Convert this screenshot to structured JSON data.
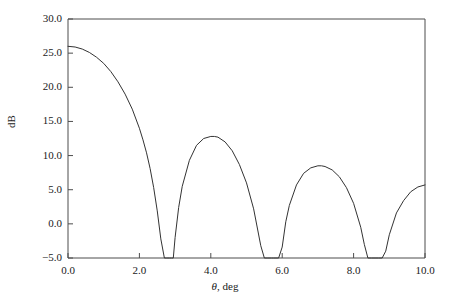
{
  "chart_data": {
    "type": "line",
    "title": "",
    "xlabel": "θ, deg",
    "ylabel": "dB",
    "xlim": [
      0.0,
      10.0
    ],
    "ylim": [
      -5.0,
      30.0
    ],
    "xticks": [
      0.0,
      2.0,
      4.0,
      6.0,
      8.0,
      10.0
    ],
    "yticks": [
      -5.0,
      0.0,
      5.0,
      10.0,
      15.0,
      20.0,
      25.0,
      30.0
    ],
    "xtick_labels": [
      "0.0",
      "2.0",
      "4.0",
      "6.0",
      "8.0",
      "10.0"
    ],
    "ytick_labels": [
      "−5.0",
      "0.0",
      "5.0",
      "10.0",
      "15.0",
      "20.0",
      "25.0",
      "30.0"
    ],
    "grid": false,
    "legend": null,
    "line_color": "#333333",
    "line_width": 1,
    "series": [
      {
        "name": "array pattern",
        "peaks": [
          {
            "x": 0.0,
            "y": 26.0
          },
          {
            "x": 4.1,
            "y": 12.8
          },
          {
            "x": 7.1,
            "y": 8.5
          },
          {
            "x": 10.0,
            "y": 5.7
          }
        ],
        "nulls": [
          2.85,
          5.75,
          8.6
        ],
        "x": [
          0.0,
          0.2,
          0.4,
          0.6,
          0.8,
          1.0,
          1.2,
          1.4,
          1.6,
          1.8,
          2.0,
          2.1,
          2.2,
          2.3,
          2.4,
          2.5,
          2.6,
          2.7,
          2.75,
          2.8,
          2.85,
          2.9,
          2.95,
          3.0,
          3.1,
          3.2,
          3.4,
          3.6,
          3.8,
          4.0,
          4.1,
          4.2,
          4.4,
          4.6,
          4.8,
          5.0,
          5.2,
          5.4,
          5.5,
          5.6,
          5.7,
          5.75,
          5.8,
          5.9,
          6.0,
          6.1,
          6.2,
          6.4,
          6.6,
          6.8,
          7.0,
          7.1,
          7.2,
          7.4,
          7.6,
          7.8,
          8.0,
          8.2,
          8.3,
          8.4,
          8.5,
          8.6,
          8.7,
          8.8,
          8.9,
          9.0,
          9.2,
          9.4,
          9.6,
          9.8,
          10.0
        ],
        "y": [
          26.0,
          25.9,
          25.6,
          25.1,
          24.4,
          23.5,
          22.3,
          20.8,
          19.0,
          16.8,
          14.0,
          12.3,
          10.4,
          8.1,
          5.3,
          1.9,
          -2.2,
          -5.0,
          -5.0,
          -5.0,
          -5.0,
          -5.0,
          -5.0,
          -2.0,
          2.4,
          5.5,
          9.3,
          11.5,
          12.5,
          12.8,
          12.8,
          12.7,
          12.0,
          10.7,
          8.7,
          6.0,
          2.2,
          -3.2,
          -5.0,
          -5.0,
          -5.0,
          -5.0,
          -5.0,
          -5.0,
          -3.4,
          0.3,
          2.7,
          5.7,
          7.4,
          8.2,
          8.5,
          8.5,
          8.4,
          7.9,
          6.9,
          5.3,
          3.0,
          -0.5,
          -3.0,
          -5.0,
          -5.0,
          -5.0,
          -5.0,
          -5.0,
          -4.0,
          -1.6,
          1.6,
          3.4,
          4.7,
          5.4,
          5.7
        ]
      }
    ]
  },
  "axes": {
    "ytick_labels": [
      "30.0",
      "25.0",
      "20.0",
      "15.0",
      "10.0",
      "5.0",
      "0.0",
      "−5.0"
    ],
    "xtick_labels": [
      "0.0",
      "2.0",
      "4.0",
      "6.0",
      "8.0",
      "10.0"
    ],
    "ylabel": "dB",
    "xlabel_symbol": "θ",
    "xlabel_units": ", deg"
  }
}
